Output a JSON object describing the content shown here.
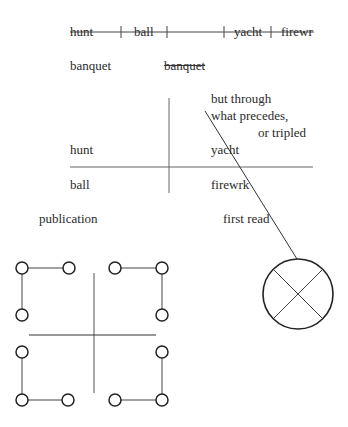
{
  "top_row": {
    "words": [
      "hunt",
      "ball",
      "",
      "yacht",
      "firewr"
    ],
    "separator": "|"
  },
  "banquet_left": "banquet",
  "banquet_struck": "banquet",
  "note": {
    "line1": "but through",
    "line2": "what precedes,",
    "line3": "or tripled"
  },
  "grid": {
    "top_left": "hunt",
    "top_right": "yacht",
    "bottom_left": "ball",
    "bottom_right": "firewrk"
  },
  "labels": {
    "publication": "publication",
    "first_read": "first read"
  },
  "colors": {
    "ink": "#2a2a2a",
    "line": "#555555",
    "background": "#ffffff"
  }
}
